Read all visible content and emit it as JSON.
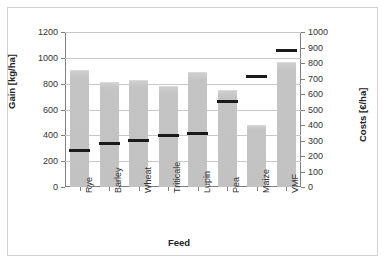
{
  "chart_data": {
    "type": "bar",
    "title": "",
    "xlabel": "Feed",
    "ylabel": "Gain [kg/ha]",
    "y2label": "Costs [€/ha]",
    "categories": [
      "Rye",
      "Barley",
      "Wheat",
      "Triticale",
      "Lupin",
      "Pea",
      "Maize",
      "VMF"
    ],
    "ylim": [
      0,
      1200
    ],
    "y2lim": [
      0,
      1000
    ],
    "yticks": [
      0,
      200,
      400,
      600,
      800,
      1000,
      1200
    ],
    "y2ticks": [
      0,
      100,
      200,
      300,
      400,
      500,
      600,
      700,
      800,
      900,
      1000
    ],
    "grid": true,
    "legend": "none",
    "series": [
      {
        "name": "Gain [kg/ha]",
        "axis": "left",
        "render": "bar",
        "color": "#c3c3c3",
        "values": [
          900,
          805,
          820,
          775,
          880,
          745,
          475,
          960
        ]
      },
      {
        "name": "Costs [€/ha]",
        "axis": "right",
        "render": "marker",
        "color": "#1a1a1a",
        "values": [
          233,
          283,
          298,
          333,
          345,
          553,
          715,
          880
        ]
      }
    ]
  },
  "axes": {
    "left": {
      "title": "Gain [kg/ha]",
      "ticks": [
        "0",
        "200",
        "400",
        "600",
        "800",
        "1000",
        "1200"
      ]
    },
    "right": {
      "title": "Costs [€/ha]",
      "ticks": [
        "0",
        "100",
        "200",
        "300",
        "400",
        "500",
        "600",
        "700",
        "800",
        "900",
        "1000"
      ]
    },
    "bottom": {
      "title": "Feed",
      "ticks": [
        "Rye",
        "Barley",
        "Wheat",
        "Triticale",
        "Lupin",
        "Pea",
        "Maize",
        "VMF"
      ]
    }
  },
  "colors": {
    "bar": "#c3c3c3",
    "marker": "#1a1a1a",
    "grid": "#c8c8c8",
    "axis": "#7f7f7f",
    "frame": "#d2d2d2",
    "background": "#ffffff"
  }
}
